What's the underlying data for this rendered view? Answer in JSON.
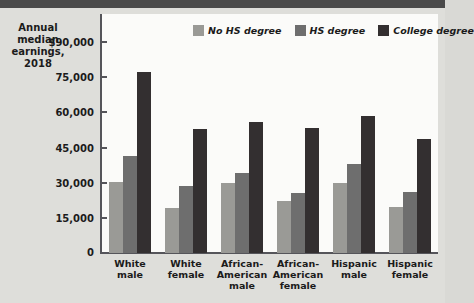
{
  "chart_data": {
    "type": "bar",
    "title": "Annual median earnings, 2018",
    "title_lines": [
      "Annual",
      "median",
      "earnings,",
      "2018"
    ],
    "xlabel": "",
    "ylabel": "",
    "ylim": [
      0,
      90000
    ],
    "grid": false,
    "legend_position": "top-right",
    "ytick_labels": [
      "$90,000",
      "75,000",
      "60,000",
      "45,000",
      "30,000",
      "15,000",
      "0"
    ],
    "ytick_values": [
      90000,
      75000,
      60000,
      45000,
      30000,
      15000,
      0
    ],
    "categories": [
      "White male",
      "White female",
      "African-American male",
      "African-American female",
      "Hispanic male",
      "Hispanic female"
    ],
    "category_lines": [
      [
        "White",
        "male"
      ],
      [
        "White",
        "female"
      ],
      [
        "African-",
        "American",
        "male"
      ],
      [
        "African-",
        "American",
        "female"
      ],
      [
        "Hispanic",
        "male"
      ],
      [
        "Hispanic",
        "female"
      ]
    ],
    "series": [
      {
        "name": "No HS degree",
        "color": "#9a9a96",
        "values": [
          30500,
          19000,
          30000,
          22000,
          30000,
          19500
        ]
      },
      {
        "name": "HS degree",
        "color": "#6e6e6e",
        "values": [
          41500,
          28500,
          34000,
          25500,
          38000,
          26000
        ]
      },
      {
        "name": "College degree",
        "color": "#332f30",
        "values": [
          77000,
          53000,
          56000,
          53500,
          58500,
          48500
        ]
      }
    ]
  },
  "colors": {
    "background": "#dededa",
    "plot_background": "#fbfbf9",
    "axis": "#55555a",
    "text": "#1b1b1b",
    "top_band": "#4a4a4a"
  }
}
